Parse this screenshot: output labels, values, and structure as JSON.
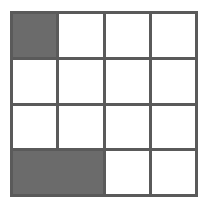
{
  "figure": {
    "name": "shaded-grid-diagram",
    "type": "grid",
    "rows": 4,
    "columns": 4,
    "colors": {
      "background": "#ffffff",
      "grid_line": "#5a5a5a",
      "empty_cell": "#ffffff",
      "filled_cell": "#6b6b6b"
    },
    "grid": [
      [
        {
          "id": "r1c1",
          "state": "filled",
          "label": ""
        },
        {
          "id": "r1c2",
          "state": "empty",
          "label": ""
        },
        {
          "id": "r1c3",
          "state": "empty",
          "label": ""
        },
        {
          "id": "r1c4",
          "state": "empty",
          "label": ""
        }
      ],
      [
        {
          "id": "r2c1",
          "state": "empty",
          "label": ""
        },
        {
          "id": "r2c2",
          "state": "empty",
          "label": ""
        },
        {
          "id": "r2c3",
          "state": "empty",
          "label": ""
        },
        {
          "id": "r2c4",
          "state": "empty",
          "label": ""
        }
      ],
      [
        {
          "id": "r3c1",
          "state": "empty",
          "label": ""
        },
        {
          "id": "r3c2",
          "state": "empty",
          "label": ""
        },
        {
          "id": "r3c3",
          "state": "empty",
          "label": ""
        },
        {
          "id": "r3c4",
          "state": "empty",
          "label": ""
        }
      ],
      [
        {
          "id": "r4c1",
          "state": "filled",
          "label": ""
        },
        {
          "id": "r4c2",
          "state": "filled",
          "label": ""
        },
        {
          "id": "r4c3",
          "state": "empty",
          "label": ""
        },
        {
          "id": "r4c4",
          "state": "empty",
          "label": ""
        }
      ]
    ],
    "filled_count": 3,
    "empty_count": 13
  }
}
